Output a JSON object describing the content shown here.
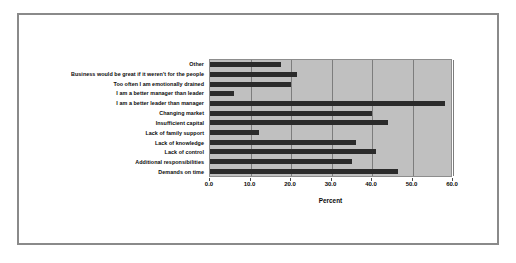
{
  "chart_data": {
    "type": "bar",
    "orientation": "horizontal",
    "title": "",
    "xlabel": "Percent",
    "ylabel": "",
    "xlim": [
      0.0,
      60.0
    ],
    "grid": "vertical",
    "legend": "none",
    "bar_color": "#2b2b2b",
    "plot_background": "#c0c0c0",
    "xticks": [
      "0.0",
      "10.0",
      "20.0",
      "30.0",
      "40.0",
      "50.0",
      "60.0"
    ],
    "xtick_values": [
      0,
      10,
      20,
      30,
      40,
      50,
      60
    ],
    "categories": [
      "Other",
      "Business would be great if it weren't for the people",
      "Too often I am emotionally drained",
      "I am a better manager than leader",
      "I am a better leader than manager",
      "Changing market",
      "Insufficient capital",
      "Lack of family support",
      "Lack of knowledge",
      "Lack of control",
      "Additional responsibilities",
      "Demands on time"
    ],
    "values": [
      17.5,
      21.5,
      20.0,
      6.0,
      58.0,
      40.0,
      44.0,
      12.0,
      36.0,
      41.0,
      35.0,
      46.5
    ]
  },
  "figure": {
    "top_clipped_title": ""
  }
}
